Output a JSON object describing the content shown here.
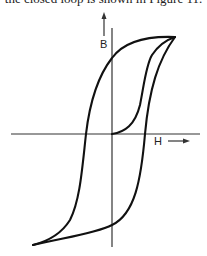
{
  "caption": "the closed loop is shown in Figure 11.",
  "figure": {
    "type": "hysteresis-loop",
    "y_axis_label": "B",
    "x_axis_label": "H",
    "curves": [
      "initial-magnetization-curve",
      "upper-branch",
      "lower-branch"
    ]
  },
  "colors": {
    "ink": "#111111",
    "background": "#ffffff"
  }
}
